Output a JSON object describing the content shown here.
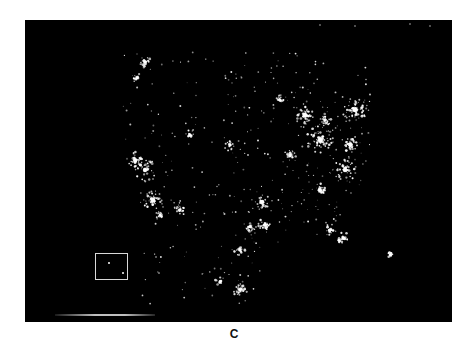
{
  "figure": {
    "panel_label": "C",
    "background_color": "#000000",
    "light_color": "#ffffff",
    "inset": {
      "name": "hawaii-inset",
      "border_color": "#d8d8d8"
    },
    "clusters": [
      {
        "name": "seattle",
        "x": 120,
        "y": 42,
        "r": 6,
        "n": 30
      },
      {
        "name": "portland",
        "x": 112,
        "y": 58,
        "r": 5,
        "n": 18
      },
      {
        "name": "sf-bay",
        "x": 110,
        "y": 140,
        "r": 8,
        "n": 45
      },
      {
        "name": "central-valley",
        "x": 120,
        "y": 150,
        "r": 12,
        "n": 40
      },
      {
        "name": "los-angeles",
        "x": 128,
        "y": 180,
        "r": 10,
        "n": 60
      },
      {
        "name": "san-diego",
        "x": 135,
        "y": 195,
        "r": 5,
        "n": 20
      },
      {
        "name": "phoenix",
        "x": 155,
        "y": 190,
        "r": 6,
        "n": 28
      },
      {
        "name": "salt-lake",
        "x": 165,
        "y": 115,
        "r": 5,
        "n": 18
      },
      {
        "name": "denver",
        "x": 205,
        "y": 125,
        "r": 6,
        "n": 24
      },
      {
        "name": "dallas",
        "x": 237,
        "y": 182,
        "r": 8,
        "n": 40
      },
      {
        "name": "houston",
        "x": 240,
        "y": 205,
        "r": 7,
        "n": 35
      },
      {
        "name": "san-antonio",
        "x": 225,
        "y": 207,
        "r": 5,
        "n": 20
      },
      {
        "name": "minneapolis",
        "x": 255,
        "y": 80,
        "r": 5,
        "n": 22
      },
      {
        "name": "chicago",
        "x": 280,
        "y": 95,
        "r": 9,
        "n": 60
      },
      {
        "name": "detroit",
        "x": 300,
        "y": 100,
        "r": 6,
        "n": 30
      },
      {
        "name": "st-louis",
        "x": 265,
        "y": 135,
        "r": 6,
        "n": 28
      },
      {
        "name": "atlanta",
        "x": 295,
        "y": 170,
        "r": 7,
        "n": 38
      },
      {
        "name": "ohio-valley",
        "x": 295,
        "y": 120,
        "r": 14,
        "n": 70
      },
      {
        "name": "northeast",
        "x": 330,
        "y": 90,
        "r": 14,
        "n": 80
      },
      {
        "name": "dc-baltimore",
        "x": 325,
        "y": 125,
        "r": 7,
        "n": 40
      },
      {
        "name": "carolinas",
        "x": 320,
        "y": 150,
        "r": 12,
        "n": 50
      },
      {
        "name": "florida-east",
        "x": 318,
        "y": 218,
        "r": 6,
        "n": 35
      },
      {
        "name": "florida-west",
        "x": 305,
        "y": 210,
        "r": 6,
        "n": 25
      },
      {
        "name": "monterrey",
        "x": 215,
        "y": 230,
        "r": 6,
        "n": 22
      },
      {
        "name": "mexico-city",
        "x": 215,
        "y": 270,
        "r": 7,
        "n": 38
      },
      {
        "name": "guadalajara",
        "x": 195,
        "y": 262,
        "r": 5,
        "n": 18
      },
      {
        "name": "puerto-rico",
        "x": 365,
        "y": 235,
        "r": 3,
        "n": 14
      }
    ],
    "scatter": {
      "x_min": 95,
      "x_max": 345,
      "y_min": 30,
      "y_max": 285,
      "n": 900
    }
  }
}
